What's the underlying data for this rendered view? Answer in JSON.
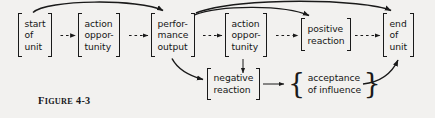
{
  "figure": {
    "caption_prefix": "F",
    "caption_word": "IGURE",
    "caption_number": "4-3",
    "caption_full": "FIGURE 4-3",
    "background_color": "#f2f1ef",
    "ink_color": "#1a1a1a"
  },
  "diagram": {
    "type": "flowchart",
    "nodes": [
      {
        "id": "start-of-unit",
        "bracket": "square",
        "lines": [
          "start",
          "of",
          "unit"
        ],
        "x": 18,
        "y": 13,
        "w": 40,
        "h": 44
      },
      {
        "id": "action-opportunity-1",
        "bracket": "square",
        "lines": [
          "action",
          "oppor-",
          "tunity"
        ],
        "x": 78,
        "y": 13,
        "w": 48,
        "h": 44
      },
      {
        "id": "performance-output",
        "bracket": "square",
        "lines": [
          "perfor-",
          "mance",
          "output"
        ],
        "x": 151,
        "y": 13,
        "w": 49,
        "h": 44
      },
      {
        "id": "action-opportunity-2",
        "bracket": "square",
        "lines": [
          "action",
          "oppor-",
          "tunity"
        ],
        "x": 225,
        "y": 13,
        "w": 48,
        "h": 44
      },
      {
        "id": "positive-reaction",
        "bracket": "square",
        "lines": [
          "positive",
          "reaction"
        ],
        "x": 301,
        "y": 18,
        "w": 51,
        "h": 33
      },
      {
        "id": "end-of-unit",
        "bracket": "square",
        "lines": [
          "end",
          "of",
          "unit"
        ],
        "x": 383,
        "y": 13,
        "w": 36,
        "h": 44
      },
      {
        "id": "negative-reaction",
        "bracket": "square",
        "lines": [
          "negative",
          "reaction"
        ],
        "x": 207,
        "y": 68,
        "w": 53,
        "h": 32
      },
      {
        "id": "acceptance-of-influence",
        "bracket": "curly",
        "lines": [
          "acceptance",
          "of influence"
        ],
        "x": 288,
        "y": 68,
        "w": 74,
        "h": 32
      }
    ],
    "edges": [
      {
        "id": "start-to-action1",
        "style": "dashed",
        "from": "start-of-unit",
        "to": "action-opportunity-1"
      },
      {
        "id": "action1-to-performance",
        "style": "dashed",
        "from": "action-opportunity-1",
        "to": "performance-output"
      },
      {
        "id": "performance-to-action2",
        "style": "dashed",
        "from": "performance-output",
        "to": "action-opportunity-2"
      },
      {
        "id": "action2-to-positive",
        "style": "dashed",
        "from": "action-opportunity-2",
        "to": "positive-reaction"
      },
      {
        "id": "positive-to-end",
        "style": "dashed",
        "from": "positive-reaction",
        "to": "end-of-unit"
      },
      {
        "id": "start-to-performance-curve",
        "style": "solid-curve",
        "from": "start-of-unit",
        "to": "performance-output"
      },
      {
        "id": "performance-to-positive-curve",
        "style": "solid-curve",
        "from": "performance-output",
        "to": "positive-reaction"
      },
      {
        "id": "performance-to-end-curve",
        "style": "solid-curve",
        "from": "performance-output",
        "to": "end-of-unit"
      },
      {
        "id": "performance-to-negative-curve",
        "style": "solid-curve",
        "from": "performance-output",
        "to": "negative-reaction"
      },
      {
        "id": "action2-to-negative",
        "style": "solid-straight",
        "from": "action-opportunity-2",
        "to": "negative-reaction"
      },
      {
        "id": "negative-to-acceptance",
        "style": "solid-straight",
        "from": "negative-reaction",
        "to": "acceptance-of-influence"
      },
      {
        "id": "acceptance-to-end-curve",
        "style": "solid-curve",
        "from": "acceptance-of-influence",
        "to": "end-of-unit"
      }
    ]
  }
}
